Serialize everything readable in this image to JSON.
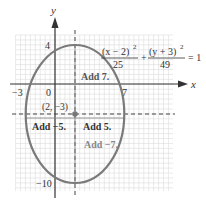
{
  "chart_data": {
    "type": "line",
    "title": "",
    "xlabel": "x",
    "ylabel": "y",
    "equation": {
      "term1_num": "(x − 2)",
      "term1_exp": "2",
      "term1_den": "25",
      "plus": "+",
      "term2_num": "(y + 3)",
      "term2_exp": "2",
      "term2_den": "49",
      "rhs": "= 1"
    },
    "ellipse": {
      "center": [
        2,
        -3
      ],
      "a_horizontal": 5,
      "b_vertical": 7
    },
    "center_label": "(2, −3)",
    "tick_labels": {
      "x_left": "−3",
      "origin": "0",
      "x_right": "7",
      "y_top": "4",
      "y_bottom": "−10"
    },
    "annotations": [
      {
        "text": "Add 7.",
        "direction": "up"
      },
      {
        "text": "Add −5.",
        "direction": "left"
      },
      {
        "text": "Add 5.",
        "direction": "right"
      },
      {
        "text": "Add −7.",
        "direction": "down"
      }
    ],
    "xlim": [
      -4,
      12
    ],
    "ylim": [
      -11,
      5
    ],
    "grid": true,
    "colors": {
      "ellipse": "#777777",
      "axis": "#333333",
      "grid": "#d8d8d8",
      "point": "#777777"
    }
  }
}
